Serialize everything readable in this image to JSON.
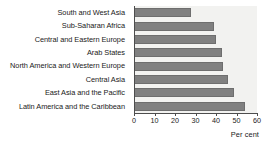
{
  "chart_data": {
    "type": "bar",
    "orientation": "horizontal",
    "title": "",
    "xlabel": "Per cent",
    "ylabel": "",
    "xlim": [
      0,
      60
    ],
    "xticks": [
      0,
      10,
      20,
      30,
      40,
      50,
      60
    ],
    "grid": false,
    "legend": null,
    "categories": [
      "South and West Asia",
      "Sub-Saharan Africa",
      "Central and Eastern Europe",
      "Arab States",
      "North America and Western Europe",
      "Central Asia",
      "East Asia and the Pacific",
      "Latin America and the Caribbean"
    ],
    "values": [
      28,
      39,
      40,
      43,
      43.5,
      46,
      49,
      54
    ],
    "series": [
      {
        "name": "Per cent",
        "values": [
          28,
          39,
          40,
          43,
          43.5,
          46,
          49,
          54
        ]
      }
    ]
  },
  "style": {
    "bar_color": "#808080",
    "bar_edge_color": "#6e6e6e",
    "plot_background": "#f2f2f0",
    "axis_color": "#4d4d4d",
    "text_color": "#1a1a1a",
    "page_background": "#ffffff"
  }
}
